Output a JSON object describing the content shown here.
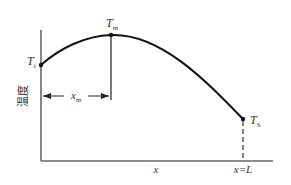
{
  "diagram": {
    "y_axis_label": "温度",
    "x_axis_label": "x",
    "end_label": "x=L",
    "points": {
      "inlet": {
        "symbol": "T",
        "subscript": "i"
      },
      "max": {
        "symbol": "T",
        "subscript": "m"
      },
      "surface": {
        "symbol": "T",
        "subscript": "S"
      }
    },
    "distance_label": {
      "symbol": "x",
      "subscript": "m"
    }
  }
}
